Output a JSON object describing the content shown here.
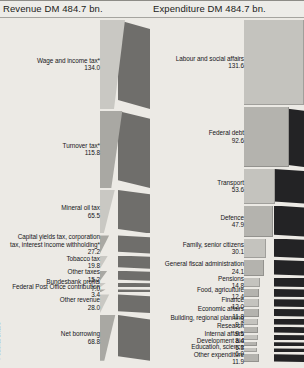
{
  "figure": {
    "footnote": "* Federal share",
    "colors": {
      "background": "#e8e7e2",
      "panel_background": "#eceae5",
      "wedge_face": "#c9c8c3",
      "wedge_shade": "#a9a8a3",
      "side_panel_left": "#6f6e6b",
      "side_panel_right": "#232325",
      "text": "#17171a"
    }
  },
  "revenue": {
    "title": "Revenue DM 484.7 bn.",
    "total": 484.7,
    "currency": "DM",
    "unit": "bn."
  },
  "expenditure": {
    "title": "Expenditure DM 484.7 bn.",
    "total": 484.7,
    "currency": "DM",
    "unit": "bn."
  },
  "chart_data": [
    {
      "type": "bar",
      "title": "Revenue DM 484.7 bn.",
      "xlabel": "",
      "ylabel": "",
      "orientation": "horizontal",
      "total": 484.7,
      "categories": [
        "Wage and income tax*",
        "Turnover tax*",
        "Mineral oil tax",
        "Capital yields tax, corporation tax, interest income withholding*",
        "Tobacco tax",
        "Other taxes",
        "Bundesbank profits",
        "Federal Post Office contribution",
        "Other revenue",
        "Net borrowing"
      ],
      "values": [
        134.0,
        115.8,
        65.5,
        27.2,
        19.8,
        15.2,
        7.0,
        3.4,
        28.0,
        68.8
      ],
      "labels": [
        {
          "name": "Wage and income tax*",
          "value": 134.0,
          "display": "134.0"
        },
        {
          "name": "Turnover tax*",
          "value": 115.8,
          "display": "115.8"
        },
        {
          "name": "Mineral oil tax",
          "value": 65.5,
          "display": "65.5"
        },
        {
          "name": "Capital yields tax, corporation tax, interest income withholding*",
          "value": 27.2,
          "display": "27.2"
        },
        {
          "name": "Tobacco tax",
          "value": 19.8,
          "display": "19.8"
        },
        {
          "name": "Other taxes",
          "value": 15.2,
          "display": "15.2"
        },
        {
          "name": "Bundesbank profits",
          "value": 7.0,
          "display": "7.0"
        },
        {
          "name": "Federal Post Office contribution",
          "value": 3.4,
          "display": "3.4"
        },
        {
          "name": "Other revenue",
          "value": 28.0,
          "display": "28.0"
        },
        {
          "name": "Net borrowing",
          "value": 68.8,
          "display": "68.8"
        }
      ]
    },
    {
      "type": "bar",
      "title": "Expenditure DM 484.7 bn.",
      "xlabel": "",
      "ylabel": "",
      "orientation": "horizontal",
      "total": 484.7,
      "categories": [
        "Labour and social affairs",
        "Federal debt",
        "Transport",
        "Defence",
        "Family, senior citizens",
        "General fiscal administration",
        "Pensions",
        "Food, agriculture",
        "Finance",
        "Economic affairs",
        "Building, regional planning",
        "Research",
        "Internal affairs",
        "Development aid",
        "Education, science",
        "Other expenditure"
      ],
      "values": [
        131.6,
        92.6,
        53.6,
        47.9,
        30.1,
        24.1,
        14.8,
        12.4,
        12.0,
        11.8,
        9.7,
        9.5,
        8.4,
        6.3,
        6.0,
        11.9
      ],
      "labels": [
        {
          "name": "Labour and social affairs",
          "value": 131.6,
          "display": "131.6"
        },
        {
          "name": "Federal debt",
          "value": 92.6,
          "display": "92.6"
        },
        {
          "name": "Transport",
          "value": 53.6,
          "display": "53.6"
        },
        {
          "name": "Defence",
          "value": 47.9,
          "display": "47.9"
        },
        {
          "name": "Family, senior citizens",
          "value": 30.1,
          "display": "30.1"
        },
        {
          "name": "General fiscal administration",
          "value": 24.1,
          "display": "24.1"
        },
        {
          "name": "Pensions",
          "value": 14.8,
          "display": "14.8"
        },
        {
          "name": "Food, agriculture",
          "value": 12.4,
          "display": "12.4"
        },
        {
          "name": "Finance",
          "value": 12.0,
          "display": "12.0"
        },
        {
          "name": "Economic affairs",
          "value": 11.8,
          "display": "11.8"
        },
        {
          "name": "Building, regional planning",
          "value": 9.7,
          "display": "9.7"
        },
        {
          "name": "Research",
          "value": 9.5,
          "display": "9.5"
        },
        {
          "name": "Internal affairs",
          "value": 8.4,
          "display": "8.4"
        },
        {
          "name": "Development aid",
          "value": 6.3,
          "display": "6.3"
        },
        {
          "name": "Education, science",
          "value": 6.0,
          "display": "6.0"
        },
        {
          "name": "Other expenditure",
          "value": 11.9,
          "display": "11.9"
        }
      ]
    }
  ]
}
